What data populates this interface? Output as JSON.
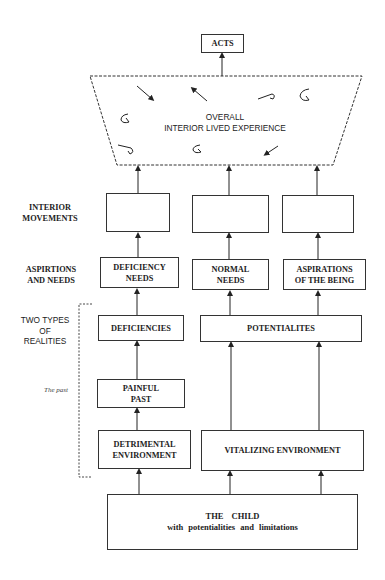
{
  "diagram": {
    "top": {
      "acts": "ACTS"
    },
    "overall": {
      "line1": "OVERALL",
      "line2": "INTERIOR LIVED EXPERIENCE"
    },
    "row_labels": {
      "interior_movements": {
        "line1": "INTERIOR",
        "line2": "MOVEMENTS"
      },
      "aspirations_needs": {
        "line1": "ASPIRTIONS",
        "line2": "AND NEEDS"
      },
      "two_types": {
        "line1": "TWO TYPES",
        "line2": "OF",
        "line3": "REALITIES"
      },
      "the_past": "The past"
    },
    "needs": {
      "deficiency": {
        "line1": "DEFICIENCY",
        "line2": "NEEDS"
      },
      "normal": {
        "line1": "NORMAL",
        "line2": "NEEDS"
      },
      "aspirations": {
        "line1": "ASPIRATIONS",
        "line2": "OF THE BEING"
      }
    },
    "realities": {
      "deficiencies": "DEFICIENCIES",
      "potentialites": "POTENTIALITES"
    },
    "past": {
      "line1": "PAINFUL",
      "line2": "PAST"
    },
    "environments": {
      "detrimental": {
        "line1": "DETRIMENTAL",
        "line2": "ENVIRONMENT"
      },
      "vitalizing": "VITALIZING ENVIRONMENT"
    },
    "child": {
      "title": "THE CHILD",
      "subtitle": "with potentialities and limitations"
    },
    "movement_icons": [
      "circular-turning-movement-icon",
      "rising-then-curling-back-movement-icon",
      "rising-straight-movement-icon"
    ]
  }
}
